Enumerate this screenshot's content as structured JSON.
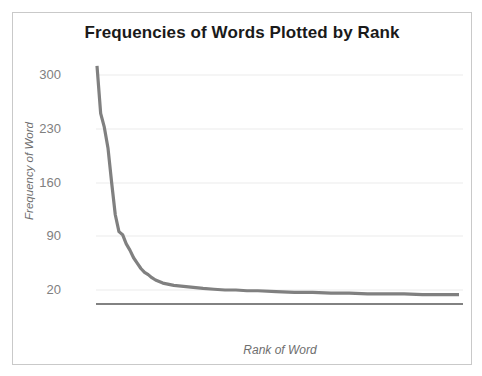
{
  "figure": {
    "title": "Frequencies of Words Plotted by Rank",
    "border_color": "#c9c9c9",
    "background": "#ffffff"
  },
  "axes": {
    "y_title": "Frequency of Word",
    "x_title": "Rank of Word",
    "y_ticks": [
      "300",
      "230",
      "160",
      "90",
      "20"
    ],
    "tick_color": "#808080",
    "gridline_color": "#ebebeb",
    "axis_line_color": "#595959"
  },
  "chart_data": {
    "type": "line",
    "title": "Frequencies of Words Plotted by Rank",
    "xlabel": "Rank of Word",
    "ylabel": "Frequency of Word",
    "grid": true,
    "legend": "none",
    "series_color": "#808080",
    "ylim": [
      0,
      315
    ],
    "xlim": [
      1,
      100
    ],
    "yticks": [
      20,
      90,
      160,
      230,
      300
    ],
    "xticks": [],
    "series": [
      {
        "name": "Word frequency",
        "x": [
          1,
          2,
          3,
          4,
          5,
          6,
          7,
          8,
          9,
          10,
          11,
          12,
          13,
          14,
          15,
          16,
          17,
          18,
          19,
          20,
          22,
          24,
          26,
          28,
          30,
          33,
          36,
          39,
          42,
          45,
          50,
          55,
          60,
          65,
          70,
          75,
          80,
          85,
          90,
          95,
          100
        ],
        "values": [
          312,
          250,
          232,
          205,
          160,
          118,
          96,
          92,
          80,
          72,
          62,
          55,
          48,
          43,
          40,
          36,
          33,
          31,
          29,
          28,
          26,
          25,
          24,
          23,
          22,
          21,
          20,
          20,
          19,
          19,
          18,
          17,
          17,
          16,
          16,
          15,
          15,
          15,
          14,
          14,
          14
        ]
      }
    ]
  }
}
